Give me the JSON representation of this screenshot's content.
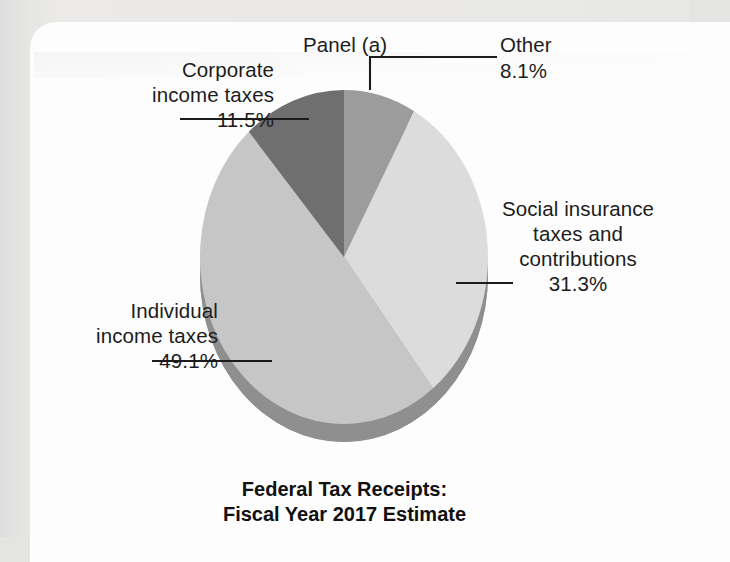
{
  "figure": {
    "panel_label": "Panel (a)",
    "title_line1": "Federal Tax Receipts:",
    "title_line2": "Fiscal Year 2017 Estimate"
  },
  "chart_data": {
    "type": "pie",
    "title": "Federal Tax Receipts: Fiscal Year 2017 Estimate",
    "panel": "Panel (a)",
    "units": "percent",
    "legend_position": "callout-labels",
    "grid": false,
    "three_d": true,
    "start_angle_deg": 0,
    "direction": "clockwise",
    "categories": [
      "Other",
      "Social insurance taxes and contributions",
      "Individual income taxes",
      "Corporate income taxes"
    ],
    "values": [
      8.1,
      31.3,
      49.1,
      11.5
    ],
    "labels": [
      {
        "name": "other",
        "line1": "Other",
        "percent": "8.1%",
        "color": "#9c9c9c"
      },
      {
        "name": "social-insurance",
        "line1": "Social insurance",
        "line2": "taxes and",
        "line3": "contributions",
        "percent": "31.3%",
        "color": "#dcdcdc"
      },
      {
        "name": "individual-income-taxes",
        "line1": "Individual",
        "line2": "income taxes",
        "percent": "49.1%",
        "color": "#c6c6c6"
      },
      {
        "name": "corporate-income-taxes",
        "line1": "Corporate",
        "line2": "income taxes",
        "percent": "11.5%",
        "color": "#6f6f6f"
      }
    ],
    "colors": {
      "other": "#9c9c9c",
      "social_insurance": "#dcdcdc",
      "individual": "#c6c6c6",
      "corporate": "#6f6f6f",
      "rim": "#9a9a9a",
      "rim_dark": "#8a8a8a",
      "leader_line": "#1b1b1b",
      "text": "#1c1c1c",
      "card": "#fdfdfd",
      "page": "#e4e4e2"
    }
  }
}
